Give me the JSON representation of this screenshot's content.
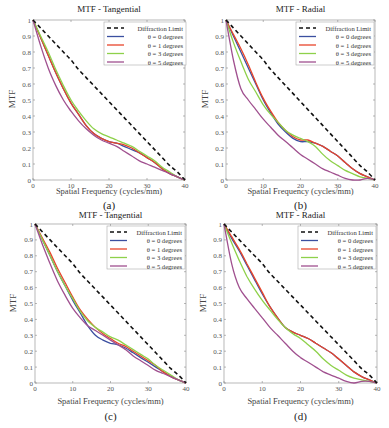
{
  "figure": {
    "captions": [
      "(a)",
      "(b)",
      "(c)",
      "(d)"
    ]
  },
  "colors": {
    "diffraction": "#111111",
    "theta0": "#3b4fa0",
    "theta1": "#e8452a",
    "theta3": "#8ed14a",
    "theta5": "#a0508f"
  },
  "chart_data": [
    {
      "type": "line",
      "panel": "a",
      "title": "MTF - Tangential",
      "xlabel": "Spatial Frequency (cycles/mm)",
      "ylabel": "MTF",
      "caption": "(a)",
      "xlim": [
        0,
        40
      ],
      "ylim": [
        0,
        1
      ],
      "xticks": [
        0,
        10,
        20,
        30,
        40
      ],
      "yticks": [
        0,
        0.1,
        0.2,
        0.3,
        0.4,
        0.5,
        0.6,
        0.7,
        0.8,
        0.9,
        1
      ],
      "grid": false,
      "legend_position": "upper right",
      "x": [
        0,
        2,
        4,
        6,
        8,
        10,
        12,
        14,
        16,
        18,
        20,
        22,
        24,
        26,
        28,
        30,
        32,
        34,
        36,
        38,
        40
      ],
      "series": [
        {
          "name": "Diffraction Limit",
          "style": "dashed",
          "color_key": "diffraction",
          "values": [
            1.0,
            0.95,
            0.9,
            0.85,
            0.8,
            0.75,
            0.69,
            0.64,
            0.59,
            0.54,
            0.49,
            0.44,
            0.39,
            0.34,
            0.29,
            0.24,
            0.19,
            0.14,
            0.09,
            0.05,
            0.0
          ]
        },
        {
          "name": "θ = 0 degrees",
          "style": "solid",
          "color_key": "theta0",
          "values": [
            1.0,
            0.89,
            0.78,
            0.67,
            0.57,
            0.48,
            0.41,
            0.34,
            0.29,
            0.26,
            0.24,
            0.23,
            0.21,
            0.19,
            0.17,
            0.14,
            0.11,
            0.07,
            0.04,
            0.02,
            0.0
          ]
        },
        {
          "name": "θ = 1 degrees",
          "style": "solid",
          "color_key": "theta1",
          "values": [
            1.0,
            0.89,
            0.78,
            0.67,
            0.57,
            0.48,
            0.41,
            0.34,
            0.29,
            0.26,
            0.24,
            0.23,
            0.22,
            0.2,
            0.17,
            0.14,
            0.11,
            0.07,
            0.04,
            0.02,
            0.0
          ]
        },
        {
          "name": "θ = 3 degrees",
          "style": "solid",
          "color_key": "theta3",
          "values": [
            1.0,
            0.9,
            0.8,
            0.69,
            0.59,
            0.5,
            0.43,
            0.37,
            0.32,
            0.29,
            0.27,
            0.25,
            0.23,
            0.21,
            0.18,
            0.15,
            0.12,
            0.08,
            0.05,
            0.02,
            0.0
          ]
        },
        {
          "name": "θ = 5 degrees",
          "style": "solid",
          "color_key": "theta5",
          "values": [
            1.0,
            0.84,
            0.7,
            0.59,
            0.5,
            0.43,
            0.37,
            0.32,
            0.28,
            0.25,
            0.23,
            0.21,
            0.18,
            0.15,
            0.12,
            0.1,
            0.08,
            0.06,
            0.04,
            0.02,
            0.0
          ]
        }
      ]
    },
    {
      "type": "line",
      "panel": "b",
      "title": "MTF - Radial",
      "xlabel": "Spatial Frequency (cycles/mm)",
      "ylabel": "MTF",
      "caption": "(b)",
      "xlim": [
        0,
        40
      ],
      "ylim": [
        0,
        1
      ],
      "xticks": [
        0,
        10,
        20,
        30,
        40
      ],
      "yticks": [
        0,
        0.1,
        0.2,
        0.3,
        0.4,
        0.5,
        0.6,
        0.7,
        0.8,
        0.9,
        1
      ],
      "grid": false,
      "legend_position": "upper right",
      "x": [
        0,
        2,
        4,
        6,
        8,
        10,
        12,
        14,
        16,
        18,
        20,
        22,
        24,
        26,
        28,
        30,
        32,
        34,
        36,
        38,
        40
      ],
      "series": [
        {
          "name": "Diffraction Limit",
          "style": "dashed",
          "color_key": "diffraction",
          "values": [
            1.0,
            0.95,
            0.9,
            0.85,
            0.8,
            0.75,
            0.69,
            0.64,
            0.59,
            0.54,
            0.49,
            0.44,
            0.39,
            0.34,
            0.29,
            0.24,
            0.19,
            0.14,
            0.09,
            0.05,
            0.0
          ]
        },
        {
          "name": "θ = 0 degrees",
          "style": "solid",
          "color_key": "theta0",
          "values": [
            1.0,
            0.9,
            0.8,
            0.7,
            0.6,
            0.5,
            0.42,
            0.35,
            0.3,
            0.26,
            0.24,
            0.24,
            0.23,
            0.21,
            0.18,
            0.15,
            0.11,
            0.07,
            0.04,
            0.02,
            0.0
          ]
        },
        {
          "name": "θ = 1 degrees",
          "style": "solid",
          "color_key": "theta1",
          "values": [
            1.0,
            0.91,
            0.82,
            0.72,
            0.61,
            0.51,
            0.43,
            0.36,
            0.31,
            0.27,
            0.25,
            0.25,
            0.23,
            0.21,
            0.18,
            0.15,
            0.11,
            0.07,
            0.04,
            0.02,
            0.0
          ]
        },
        {
          "name": "θ = 3 degrees",
          "style": "solid",
          "color_key": "theta3",
          "values": [
            1.0,
            0.86,
            0.74,
            0.63,
            0.55,
            0.47,
            0.41,
            0.36,
            0.31,
            0.28,
            0.26,
            0.24,
            0.21,
            0.16,
            0.12,
            0.09,
            0.06,
            0.04,
            0.02,
            0.01,
            0.0
          ]
        },
        {
          "name": "θ = 5 degrees",
          "style": "solid",
          "color_key": "theta5",
          "values": [
            1.0,
            0.75,
            0.57,
            0.5,
            0.44,
            0.38,
            0.33,
            0.28,
            0.24,
            0.2,
            0.16,
            0.13,
            0.1,
            0.07,
            0.05,
            0.03,
            0.01,
            0.0,
            0.0,
            0.01,
            0.0
          ]
        }
      ]
    },
    {
      "type": "line",
      "panel": "c",
      "title": "MTF - Tangential",
      "xlabel": "Spatial Frequency (cycles/mm)",
      "ylabel": "MTF",
      "caption": "(c)",
      "xlim": [
        0,
        40
      ],
      "ylim": [
        0,
        1
      ],
      "xticks": [
        0,
        10,
        20,
        30,
        40
      ],
      "yticks": [
        0,
        0.1,
        0.2,
        0.3,
        0.4,
        0.5,
        0.6,
        0.7,
        0.8,
        0.9,
        1
      ],
      "grid": false,
      "legend_position": "upper right",
      "x": [
        0,
        2,
        4,
        6,
        8,
        10,
        12,
        14,
        16,
        18,
        20,
        22,
        24,
        26,
        28,
        30,
        32,
        34,
        36,
        38,
        40
      ],
      "series": [
        {
          "name": "Diffraction Limit",
          "style": "dashed",
          "color_key": "diffraction",
          "values": [
            1.0,
            0.95,
            0.9,
            0.85,
            0.8,
            0.75,
            0.69,
            0.64,
            0.59,
            0.54,
            0.49,
            0.44,
            0.39,
            0.34,
            0.29,
            0.24,
            0.19,
            0.14,
            0.09,
            0.05,
            0.0
          ]
        },
        {
          "name": "θ = 0 degrees",
          "style": "solid",
          "color_key": "theta0",
          "values": [
            1.0,
            0.9,
            0.8,
            0.7,
            0.61,
            0.52,
            0.44,
            0.36,
            0.3,
            0.27,
            0.25,
            0.24,
            0.22,
            0.19,
            0.16,
            0.13,
            0.1,
            0.07,
            0.04,
            0.02,
            0.0
          ]
        },
        {
          "name": "θ = 1 degrees",
          "style": "solid",
          "color_key": "theta1",
          "values": [
            1.0,
            0.91,
            0.82,
            0.72,
            0.63,
            0.54,
            0.46,
            0.4,
            0.35,
            0.31,
            0.28,
            0.25,
            0.23,
            0.2,
            0.17,
            0.14,
            0.11,
            0.07,
            0.04,
            0.02,
            0.0
          ]
        },
        {
          "name": "θ = 3 degrees",
          "style": "solid",
          "color_key": "theta3",
          "values": [
            1.0,
            0.9,
            0.8,
            0.7,
            0.61,
            0.53,
            0.45,
            0.39,
            0.35,
            0.32,
            0.29,
            0.27,
            0.24,
            0.21,
            0.18,
            0.15,
            0.11,
            0.08,
            0.05,
            0.02,
            0.0
          ]
        },
        {
          "name": "θ = 5 degrees",
          "style": "solid",
          "color_key": "theta5",
          "values": [
            1.0,
            0.87,
            0.75,
            0.64,
            0.55,
            0.47,
            0.41,
            0.36,
            0.33,
            0.3,
            0.27,
            0.24,
            0.21,
            0.17,
            0.14,
            0.11,
            0.08,
            0.06,
            0.04,
            0.02,
            0.0
          ]
        }
      ]
    },
    {
      "type": "line",
      "panel": "d",
      "title": "MTF - Radial",
      "xlabel": "Spatial Frequency (cycles/mm)",
      "ylabel": "MTF",
      "caption": "(d)",
      "xlim": [
        0,
        40
      ],
      "ylim": [
        0,
        1
      ],
      "xticks": [
        0,
        10,
        20,
        30,
        40
      ],
      "yticks": [
        0,
        0.1,
        0.2,
        0.3,
        0.4,
        0.5,
        0.6,
        0.7,
        0.8,
        0.9,
        1
      ],
      "grid": false,
      "legend_position": "upper right",
      "x": [
        0,
        2,
        4,
        6,
        8,
        10,
        12,
        14,
        16,
        18,
        20,
        22,
        24,
        26,
        28,
        30,
        32,
        34,
        36,
        38,
        40
      ],
      "series": [
        {
          "name": "Diffraction Limit",
          "style": "dashed",
          "color_key": "diffraction",
          "values": [
            1.0,
            0.95,
            0.9,
            0.85,
            0.8,
            0.75,
            0.69,
            0.64,
            0.59,
            0.54,
            0.49,
            0.44,
            0.39,
            0.34,
            0.29,
            0.24,
            0.19,
            0.14,
            0.09,
            0.05,
            0.0
          ]
        },
        {
          "name": "θ = 0 degrees",
          "style": "solid",
          "color_key": "theta0",
          "values": [
            1.0,
            0.91,
            0.83,
            0.74,
            0.65,
            0.56,
            0.48,
            0.41,
            0.35,
            0.32,
            0.3,
            0.28,
            0.25,
            0.22,
            0.19,
            0.15,
            0.11,
            0.07,
            0.04,
            0.02,
            0.0
          ]
        },
        {
          "name": "θ = 1 degrees",
          "style": "solid",
          "color_key": "theta1",
          "values": [
            1.0,
            0.92,
            0.84,
            0.75,
            0.66,
            0.57,
            0.48,
            0.41,
            0.35,
            0.32,
            0.3,
            0.28,
            0.25,
            0.22,
            0.19,
            0.15,
            0.11,
            0.07,
            0.04,
            0.02,
            0.0
          ]
        },
        {
          "name": "θ = 3 degrees",
          "style": "solid",
          "color_key": "theta3",
          "values": [
            1.0,
            0.88,
            0.77,
            0.67,
            0.59,
            0.52,
            0.46,
            0.4,
            0.35,
            0.31,
            0.28,
            0.24,
            0.2,
            0.15,
            0.11,
            0.08,
            0.05,
            0.03,
            0.02,
            0.01,
            0.0
          ]
        },
        {
          "name": "θ = 5 degrees",
          "style": "solid",
          "color_key": "theta5",
          "values": [
            1.0,
            0.75,
            0.6,
            0.53,
            0.47,
            0.41,
            0.35,
            0.3,
            0.25,
            0.2,
            0.16,
            0.13,
            0.1,
            0.07,
            0.05,
            0.03,
            0.01,
            0.0,
            0.01,
            0.01,
            0.0
          ]
        }
      ]
    }
  ],
  "layout_panels": [
    {
      "x0": 33,
      "x1": 185,
      "y0": 20,
      "y1": 180,
      "title_y": 4,
      "xlabel_y": 188,
      "caption_y": 200,
      "legend": {
        "x": 104,
        "y": 22,
        "w": 82,
        "h": 43
      }
    },
    {
      "x0": 226,
      "x1": 375,
      "y0": 20,
      "y1": 180,
      "title_y": 4,
      "xlabel_y": 188,
      "caption_y": 200,
      "legend": {
        "x": 296,
        "y": 22,
        "w": 78,
        "h": 43
      }
    },
    {
      "x0": 35,
      "x1": 186,
      "y0": 224,
      "y1": 383,
      "title_y": 209,
      "xlabel_y": 396,
      "caption_y": 411,
      "legend": {
        "x": 107,
        "y": 226,
        "w": 78,
        "h": 43
      }
    },
    {
      "x0": 224,
      "x1": 377,
      "y0": 224,
      "y1": 383,
      "title_y": 209,
      "xlabel_y": 396,
      "caption_y": 411,
      "legend": {
        "x": 298,
        "y": 226,
        "w": 78,
        "h": 43
      }
    }
  ]
}
